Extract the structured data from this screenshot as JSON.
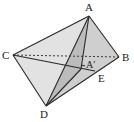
{
  "diagram": {
    "type": "3d-geometry",
    "points": {
      "A": {
        "label": "A",
        "x": 89,
        "y": 16
      },
      "B": {
        "label": "B",
        "x": 119,
        "y": 57
      },
      "C": {
        "label": "C",
        "x": 13,
        "y": 55
      },
      "D": {
        "label": "D",
        "x": 46,
        "y": 106
      },
      "E": {
        "label": "E",
        "x": 95,
        "y": 71
      },
      "A_prime": {
        "label": "A'",
        "x": 81,
        "y": 69
      }
    },
    "labels": {
      "A": "A",
      "B": "B",
      "C": "C",
      "D": "D",
      "E": "E",
      "A_prime": "A′"
    },
    "colors": {
      "face_light": "#e4e4e4",
      "face_mid": "#d0d0d0",
      "face_dark": "#bdbdbd",
      "stroke": "#2a2a2a"
    }
  }
}
